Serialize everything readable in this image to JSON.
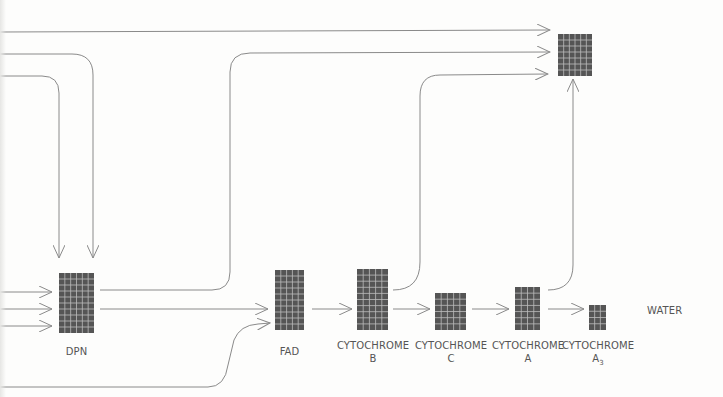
{
  "diagram": {
    "colors": {
      "background": "#fdfdfc",
      "line": "#8a8a8a",
      "block": "#555555",
      "grid": "#bdbdbd",
      "label": "#555555"
    },
    "nodes": [
      {
        "id": "dpn",
        "label": "DPN",
        "sub": "",
        "x": 59,
        "y": 273,
        "w": 35,
        "h": 60,
        "cols": 6,
        "rows": 10
      },
      {
        "id": "fad",
        "label": "FAD",
        "sub": "",
        "x": 275,
        "y": 270,
        "w": 29,
        "h": 60,
        "cols": 5,
        "rows": 10
      },
      {
        "id": "cyt-b",
        "label": "CYTOCHROME",
        "sub": "B",
        "x": 357,
        "y": 269,
        "w": 31,
        "h": 61,
        "cols": 5,
        "rows": 10
      },
      {
        "id": "cyt-c",
        "label": "CYTOCHROME",
        "sub": "C",
        "x": 435,
        "y": 293,
        "w": 31,
        "h": 37,
        "cols": 5,
        "rows": 6
      },
      {
        "id": "cyt-a",
        "label": "CYTOCHROME",
        "sub": "A",
        "x": 515,
        "y": 287,
        "w": 25,
        "h": 43,
        "cols": 4,
        "rows": 7
      },
      {
        "id": "cyt-a3",
        "label": "CYTOCHROME",
        "sub": "A",
        "sub_index": "3",
        "x": 589,
        "y": 305,
        "w": 17,
        "h": 25,
        "cols": 3,
        "rows": 4
      },
      {
        "id": "top",
        "label": "",
        "sub": "",
        "x": 558,
        "y": 34,
        "w": 34,
        "h": 42,
        "cols": 6,
        "rows": 7
      }
    ],
    "end_label": {
      "text": "WATER",
      "x": 647,
      "y": 305
    }
  }
}
